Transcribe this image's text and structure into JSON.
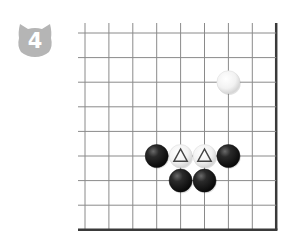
{
  "problem": {
    "number": "4",
    "badge_color": "#b5b5b5",
    "badge_shape": "cat-head-icon"
  },
  "board": {
    "origin_x": 85,
    "origin_y": 33,
    "step_x": 23.9,
    "step_y": 24.6,
    "cols": 9,
    "rows": 9,
    "edges": {
      "right": true,
      "bottom": true,
      "left": false,
      "top": false
    },
    "line_color": "#8a8a8a",
    "edge_color": "#3a3a3a",
    "stones": [
      {
        "color": "white",
        "col": 6,
        "row": 2,
        "mark": ""
      },
      {
        "color": "black",
        "col": 3,
        "row": 5,
        "mark": ""
      },
      {
        "color": "white",
        "col": 4,
        "row": 5,
        "mark": "triangle"
      },
      {
        "color": "white",
        "col": 5,
        "row": 5,
        "mark": "triangle"
      },
      {
        "color": "black",
        "col": 6,
        "row": 5,
        "mark": ""
      },
      {
        "color": "black",
        "col": 4,
        "row": 6,
        "mark": ""
      },
      {
        "color": "black",
        "col": 5,
        "row": 6,
        "mark": ""
      }
    ]
  }
}
